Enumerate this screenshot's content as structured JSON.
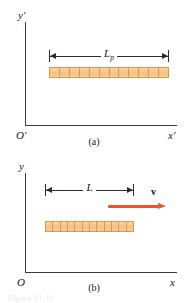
{
  "figure": {
    "title_partial": "Figure 11-11",
    "panels": [
      {
        "id": "a",
        "caption": "(a)",
        "y_axis_label": "y′",
        "x_axis_label": "x′",
        "origin_label": "O′",
        "dimension": {
          "symbol": "L",
          "subscript": "p",
          "full": "Lₚ"
        },
        "rod": {
          "segments": 12,
          "fill_color": "#f4c184",
          "border_color": "#d89a46"
        }
      },
      {
        "id": "b",
        "caption": "(b)",
        "y_axis_label": "y",
        "x_axis_label": "x",
        "origin_label": "O",
        "dimension": {
          "symbol": "L",
          "subscript": "",
          "full": "L"
        },
        "velocity": {
          "label": "v",
          "arrow_color": "#e8562a",
          "direction": "right"
        },
        "rod": {
          "segments": 12,
          "fill_color": "#f4c184",
          "border_color": "#d89a46"
        }
      }
    ],
    "colors": {
      "axis": "#3a3a46",
      "dimension_line": "#2b2b38",
      "rod_fill": "#f4c184",
      "rod_border": "#d89a46",
      "velocity_arrow": "#e8562a",
      "background": "#ffffff"
    }
  }
}
